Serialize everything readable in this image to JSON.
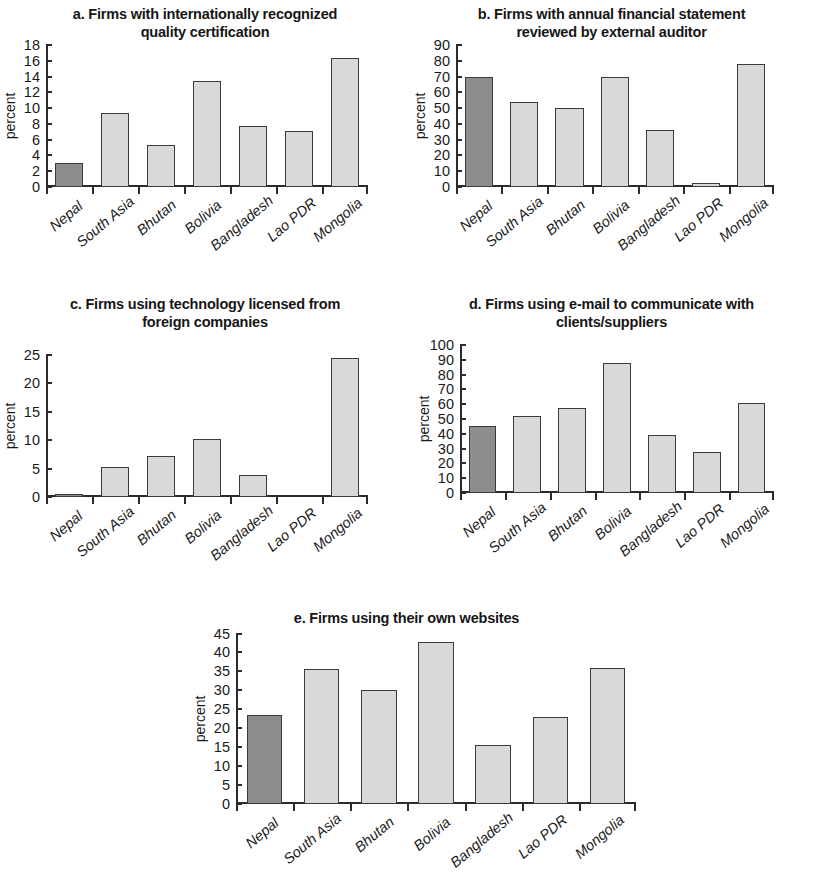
{
  "figure": {
    "categories": [
      "Nepal",
      "South Asia",
      "Bhutan",
      "Bolivia",
      "Bangladesh",
      "Lao PDR",
      "Mongolia"
    ],
    "ylabel": "percent",
    "highlight_category": "Nepal",
    "colors": {
      "highlight_bar": "#8d8d8d",
      "bar": "#d9d9d9",
      "bar_border": "#3a3a3a",
      "axis": "#2b2b2b",
      "text": "#1a1a1a",
      "background": "#ffffff"
    }
  },
  "chart_data": [
    {
      "id": "a",
      "type": "bar",
      "title": "a. Firms with internationally recognized quality certification",
      "title_line1": "a. Firms with internationally recognized",
      "title_line2": "quality certification",
      "xlabel": "",
      "ylabel": "percent",
      "categories": [
        "Nepal",
        "South Asia",
        "Bhutan",
        "Bolivia",
        "Bangladesh",
        "Lao PDR",
        "Mongolia"
      ],
      "values": [
        3.1,
        9.4,
        5.3,
        13.5,
        7.7,
        7.1,
        16.4
      ],
      "ylim": [
        0,
        18
      ],
      "yticks": [
        0,
        2,
        4,
        6,
        8,
        10,
        12,
        14,
        16,
        18
      ],
      "grid": false,
      "legend": "none"
    },
    {
      "id": "b",
      "type": "bar",
      "title": "b. Firms with annual financial statement reviewed by external auditor",
      "title_line1": "b. Firms with annual financial statement",
      "title_line2": "reviewed by external auditor",
      "xlabel": "",
      "ylabel": "percent",
      "categories": [
        "Nepal",
        "South Asia",
        "Bhutan",
        "Bolivia",
        "Bangladesh",
        "Lao PDR",
        "Mongolia"
      ],
      "values": [
        69.5,
        54.0,
        50.0,
        70.0,
        36.3,
        2.5,
        78.0
      ],
      "ylim": [
        0,
        90
      ],
      "yticks": [
        0,
        10,
        20,
        30,
        40,
        50,
        60,
        70,
        80,
        90
      ],
      "grid": false,
      "legend": "none"
    },
    {
      "id": "c",
      "type": "bar",
      "title": "c. Firms using technology licensed from foreign companies",
      "title_line1": "c. Firms using technology licensed from",
      "title_line2": "foreign companies",
      "xlabel": "",
      "ylabel": "percent",
      "categories": [
        "Nepal",
        "South Asia",
        "Bhutan",
        "Bolivia",
        "Bangladesh",
        "Lao PDR",
        "Mongolia"
      ],
      "values": [
        0.5,
        5.2,
        7.2,
        10.2,
        3.8,
        0.0,
        24.5
      ],
      "ylim": [
        0,
        25
      ],
      "yticks": [
        0,
        5,
        10,
        15,
        20,
        25
      ],
      "grid": false,
      "legend": "none"
    },
    {
      "id": "d",
      "type": "bar",
      "title": "d. Firms using e-mail to communicate with clients/suppliers",
      "title_line1": "d. Firms using e-mail to communicate with",
      "title_line2": "clients/suppliers",
      "xlabel": "",
      "ylabel": "percent",
      "categories": [
        "Nepal",
        "South Asia",
        "Bhutan",
        "Bolivia",
        "Bangladesh",
        "Lao PDR",
        "Mongolia"
      ],
      "values": [
        45.5,
        51.8,
        57.3,
        88.0,
        39.0,
        28.0,
        60.5
      ],
      "ylim": [
        0,
        100
      ],
      "yticks": [
        0,
        10,
        20,
        30,
        40,
        50,
        60,
        70,
        80,
        90,
        100
      ],
      "grid": false,
      "legend": "none"
    },
    {
      "id": "e",
      "type": "bar",
      "title": "e. Firms using their own websites",
      "title_line1": "e. Firms using their own websites",
      "title_line2": "",
      "xlabel": "",
      "ylabel": "percent",
      "categories": [
        "Nepal",
        "South Asia",
        "Bhutan",
        "Bolivia",
        "Bangladesh",
        "Lao PDR",
        "Mongolia"
      ],
      "values": [
        23.3,
        35.5,
        30.1,
        42.7,
        15.5,
        22.8,
        36.0
      ],
      "ylim": [
        0,
        45
      ],
      "yticks": [
        0,
        5,
        10,
        15,
        20,
        25,
        30,
        35,
        40,
        45
      ],
      "grid": false,
      "legend": "none"
    }
  ]
}
